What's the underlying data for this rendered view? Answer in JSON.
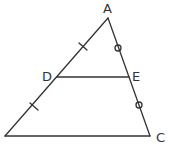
{
  "diagram": {
    "type": "triangle-midsegment",
    "stroke_color": "#333333",
    "vertices": {
      "A": {
        "label": "A",
        "x": 108,
        "y": 18
      },
      "B": {
        "label": "",
        "x": 5,
        "y": 136
      },
      "C": {
        "label": "C",
        "x": 150,
        "y": 136
      }
    },
    "points": {
      "D": {
        "label": "D",
        "x": 57,
        "y": 77
      },
      "E": {
        "label": "E",
        "x": 129,
        "y": 77
      }
    },
    "segments": [
      "AB",
      "AC",
      "BC",
      "DE"
    ],
    "marks": {
      "AD_DB": "single tick (equal)",
      "AE_EC": "small circle (equal)"
    }
  }
}
